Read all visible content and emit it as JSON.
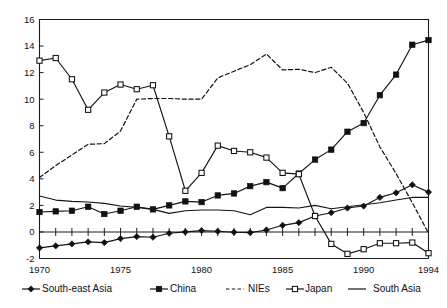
{
  "chart_data": {
    "type": "line",
    "title": "",
    "subtitle": "",
    "xlabel": "",
    "ylabel": "",
    "xlim": [
      1970,
      1994
    ],
    "ylim": [
      -2,
      16
    ],
    "grid": false,
    "legend_position": "bottom",
    "x": [
      1970,
      1971,
      1972,
      1973,
      1974,
      1975,
      1976,
      1977,
      1978,
      1979,
      1980,
      1981,
      1982,
      1983,
      1984,
      1985,
      1986,
      1987,
      1988,
      1989,
      1990,
      1991,
      1992,
      1993,
      1994
    ],
    "xticks": [
      1970,
      1975,
      1980,
      1985,
      1990,
      1994
    ],
    "xticklabels": [
      "1970",
      "1975",
      "1980",
      "1985",
      "1990",
      "1994"
    ],
    "yticks": [
      -2,
      0,
      2,
      4,
      6,
      8,
      10,
      12,
      14,
      16
    ],
    "yticklabels": [
      "-2",
      "0",
      "2",
      "4",
      "6",
      "8",
      "10",
      "12",
      "14",
      "16"
    ],
    "series": [
      {
        "name": "South-east Asia",
        "marker": "filled-diamond",
        "line": "solid",
        "color": "#111111",
        "values": [
          -1.2,
          -1.05,
          -0.9,
          -0.75,
          -0.8,
          -0.5,
          -0.35,
          -0.4,
          -0.1,
          0.0,
          0.1,
          0.05,
          -0.02,
          -0.05,
          0.15,
          0.5,
          0.7,
          1.2,
          1.45,
          1.8,
          1.95,
          2.6,
          2.95,
          3.55,
          3.0
        ]
      },
      {
        "name": "China",
        "marker": "filled-square",
        "line": "solid",
        "color": "#111111",
        "values": [
          1.5,
          1.55,
          1.6,
          1.9,
          1.35,
          1.6,
          1.9,
          1.7,
          2.0,
          2.3,
          2.25,
          2.75,
          2.9,
          3.45,
          3.75,
          3.3,
          4.4,
          5.45,
          6.2,
          7.55,
          8.2,
          10.3,
          11.85,
          14.1,
          14.45
        ]
      },
      {
        "name": "NIEs",
        "marker": "none",
        "line": "dashed",
        "color": "#141414",
        "values": [
          4.1,
          5.0,
          5.8,
          6.6,
          6.65,
          7.6,
          10.0,
          10.05,
          10.05,
          10.0,
          10.0,
          11.6,
          12.1,
          12.6,
          13.4,
          12.2,
          12.25,
          12.0,
          12.4,
          11.2,
          9.0,
          6.4,
          4.4,
          2.2,
          -0.1
        ]
      },
      {
        "name": "Japan",
        "marker": "open-square",
        "line": "solid",
        "color": "#111111",
        "values": [
          12.9,
          13.1,
          11.5,
          9.2,
          10.5,
          11.1,
          10.75,
          11.05,
          7.2,
          3.1,
          4.45,
          6.5,
          6.1,
          6.0,
          5.6,
          4.45,
          4.35,
          1.2,
          -0.9,
          -1.65,
          -1.3,
          -0.85,
          -0.85,
          -0.8,
          -1.6
        ]
      },
      {
        "name": "South Asia",
        "marker": "none",
        "line": "solid",
        "color": "#141414",
        "values": [
          2.7,
          2.4,
          2.3,
          2.25,
          2.15,
          1.95,
          1.85,
          1.7,
          1.4,
          1.6,
          1.65,
          1.65,
          1.6,
          1.3,
          1.85,
          1.85,
          1.8,
          2.0,
          1.75,
          1.9,
          2.05,
          2.2,
          2.4,
          2.6,
          2.6
        ]
      }
    ]
  },
  "legend": {
    "items": [
      {
        "label": "South-east Asia",
        "marker": "filled-diamond",
        "line": "solid"
      },
      {
        "label": "China",
        "marker": "filled-square",
        "line": "solid"
      },
      {
        "label": "NIEs",
        "marker": "none",
        "line": "dashed"
      },
      {
        "label": "Japan",
        "marker": "open-square",
        "line": "solid"
      },
      {
        "label": "South Asia",
        "marker": "none",
        "line": "solid"
      }
    ]
  }
}
